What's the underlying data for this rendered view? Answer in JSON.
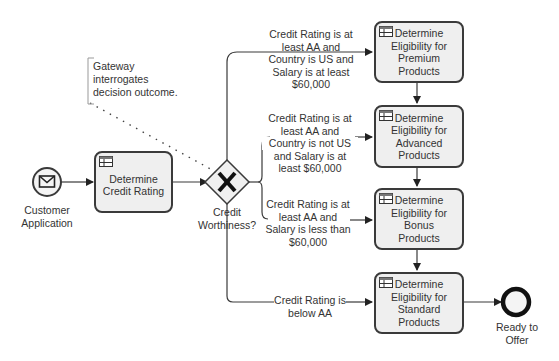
{
  "diagram": {
    "type": "BPMN process",
    "start_event": {
      "label": "Customer Application",
      "icon": "envelope-icon"
    },
    "tasks": [
      {
        "id": "credit",
        "label": "Determine Credit Rating",
        "icon": "decision-table-icon"
      },
      {
        "id": "premium",
        "label": "Determine Eligibility for Premium Products",
        "icon": "decision-table-icon"
      },
      {
        "id": "advanced",
        "label": "Determine Eligibility for Advanced Products",
        "icon": "decision-table-icon"
      },
      {
        "id": "bonus",
        "label": "Determine Eligibility for Bonus Products",
        "icon": "decision-table-icon"
      },
      {
        "id": "standard",
        "label": "Determine Eligibility for Standard Products",
        "icon": "decision-table-icon"
      }
    ],
    "gateway": {
      "type": "exclusive",
      "label": "Credit Worthiness?",
      "icon": "x-icon"
    },
    "annotation": {
      "lines": [
        "Gateway",
        "interrogates",
        "decision outcome."
      ]
    },
    "flows": [
      {
        "lines": [
          "Credit Rating is at",
          "least AA and",
          "Country is US and",
          "Salary is at least",
          "$60,000"
        ]
      },
      {
        "lines": [
          "Credit Rating is at",
          "least AA and",
          "Country is not US",
          "and Salary is at",
          "least $60,000"
        ]
      },
      {
        "lines": [
          "Credit Rating is at",
          "least AA and",
          "Salary is less than",
          "$60,000"
        ]
      },
      {
        "lines": [
          "Credit Rating is",
          "below AA"
        ]
      }
    ],
    "end_event": {
      "label_lines": [
        "Ready to",
        "Offer"
      ]
    },
    "start_label_lines": [
      "Customer",
      "Application"
    ],
    "credit_label_lines": [
      "Determine",
      "Credit Rating"
    ],
    "gateway_label_lines": [
      "Credit",
      "Worthiness?"
    ],
    "premium_lines": [
      "Determine",
      "Eligibility for",
      "Premium",
      "Products"
    ],
    "advanced_lines": [
      "Determine",
      "Eligibility for",
      "Advanced",
      "Products"
    ],
    "bonus_lines": [
      "Determine",
      "Eligibility for",
      "Bonus",
      "Products"
    ],
    "standard_lines": [
      "Determine",
      "Eligibility for",
      "Standard",
      "Products"
    ]
  },
  "colors": {
    "stroke": "#3a3a3a",
    "task_fill": "#efefef",
    "text": "#333333",
    "event_fill": "#f4f4f4"
  }
}
